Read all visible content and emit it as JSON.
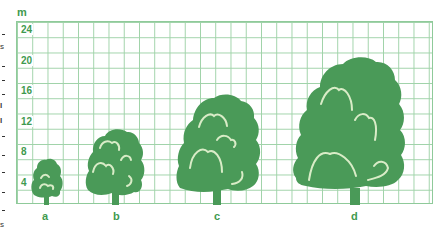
{
  "diagram": {
    "unit_label": "m",
    "y_axis_ticks": [
      "24",
      "20",
      "16",
      "12",
      "8",
      "4"
    ],
    "trees": [
      {
        "label": "a",
        "height_m": 7.5
      },
      {
        "label": "b",
        "height_m": 11
      },
      {
        "label": "c",
        "height_m": 16
      },
      {
        "label": "d",
        "height_m": 22.5
      }
    ],
    "colors": {
      "tree": "#4a9a58",
      "grid": "#9fd2a8",
      "text": "#3f9a4f"
    }
  }
}
